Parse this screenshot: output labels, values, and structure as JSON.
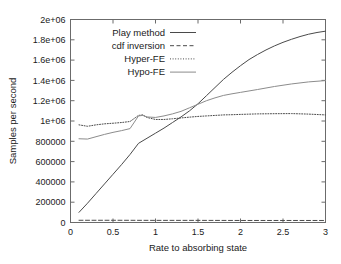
{
  "chart_data": {
    "type": "line",
    "title": "",
    "xlabel": "Rate to absorbing state",
    "ylabel": "Samples per second",
    "xlim": [
      0,
      3
    ],
    "ylim": [
      0,
      2000000
    ],
    "grid": false,
    "legend_position": "top-left",
    "xticks": [
      "0",
      "0.5",
      "1",
      "1.5",
      "2",
      "2.5",
      "3"
    ],
    "xtick_values": [
      0,
      0.5,
      1,
      1.5,
      2,
      2.5,
      3
    ],
    "yticks": [
      "0",
      "200000",
      "400000",
      "600000",
      "800000",
      "1e+06",
      "1.2e+06",
      "1.4e+06",
      "1.6e+06",
      "1.8e+06",
      "2e+06"
    ],
    "ytick_values": [
      0,
      200000,
      400000,
      600000,
      800000,
      1000000,
      1200000,
      1400000,
      1600000,
      1800000,
      2000000
    ],
    "series": [
      {
        "name": "Play method",
        "style": "solid",
        "color": "#4a4a4a",
        "x": [
          0.1,
          0.2,
          0.3,
          0.4,
          0.5,
          0.6,
          0.7,
          0.8,
          0.9,
          1.0,
          1.1,
          1.2,
          1.3,
          1.4,
          1.5,
          1.6,
          1.7,
          1.8,
          1.9,
          2.0,
          2.1,
          2.2,
          2.3,
          2.4,
          2.5,
          2.6,
          2.7,
          2.8,
          2.9,
          3.0
        ],
        "y": [
          100000,
          190000,
          285000,
          380000,
          475000,
          570000,
          670000,
          780000,
          830000,
          880000,
          930000,
          985000,
          1040000,
          1100000,
          1170000,
          1250000,
          1330000,
          1410000,
          1480000,
          1545000,
          1605000,
          1655000,
          1700000,
          1740000,
          1775000,
          1805000,
          1832000,
          1855000,
          1872000,
          1885000
        ]
      },
      {
        "name": "cdf inversion",
        "style": "dashed",
        "color": "#4a4a4a",
        "x": [
          0.1,
          0.5,
          1.0,
          1.5,
          2.0,
          2.5,
          3.0
        ],
        "y": [
          22000,
          22000,
          21000,
          21000,
          20000,
          20000,
          20000
        ]
      },
      {
        "name": "Hyper-FE",
        "style": "dotted",
        "color": "#4a4a4a",
        "x": [
          0.1,
          0.2,
          0.3,
          0.4,
          0.5,
          0.6,
          0.7,
          0.8,
          0.85,
          0.9,
          1.0,
          1.1,
          1.2,
          1.3,
          1.4,
          1.5,
          1.6,
          1.7,
          1.8,
          1.9,
          2.0,
          2.2,
          2.4,
          2.6,
          2.8,
          3.0
        ],
        "y": [
          962000,
          948000,
          962000,
          972000,
          978000,
          985000,
          995000,
          1055000,
          1060000,
          1035000,
          1015000,
          1015000,
          1022000,
          1030000,
          1038000,
          1045000,
          1050000,
          1055000,
          1060000,
          1062000,
          1065000,
          1070000,
          1072000,
          1073000,
          1068000,
          1060000
        ]
      },
      {
        "name": "Hypo-FE",
        "style": "solid",
        "color": "#8c8c8c",
        "x": [
          0.1,
          0.2,
          0.3,
          0.4,
          0.5,
          0.6,
          0.7,
          0.8,
          0.85,
          0.9,
          1.0,
          1.1,
          1.2,
          1.3,
          1.4,
          1.5,
          1.6,
          1.7,
          1.8,
          1.9,
          2.0,
          2.2,
          2.4,
          2.6,
          2.8,
          3.0
        ],
        "y": [
          825000,
          822000,
          845000,
          868000,
          888000,
          905000,
          925000,
          1050000,
          1055000,
          1040000,
          1035000,
          1050000,
          1070000,
          1095000,
          1130000,
          1165000,
          1200000,
          1228000,
          1252000,
          1268000,
          1282000,
          1310000,
          1340000,
          1365000,
          1385000,
          1398000
        ]
      }
    ]
  },
  "legend": {
    "items": [
      {
        "label": "Play method"
      },
      {
        "label": "cdf inversion"
      },
      {
        "label": "Hyper-FE"
      },
      {
        "label": "Hypo-FE"
      }
    ]
  }
}
